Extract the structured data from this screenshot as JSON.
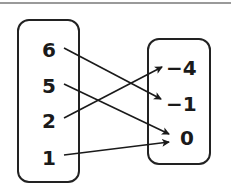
{
  "diagram": {
    "type": "mapping",
    "domain": [
      "6",
      "5",
      "2",
      "1"
    ],
    "range": [
      "−4",
      "−1",
      "0"
    ],
    "mappings": [
      {
        "from": "6",
        "to": "−1"
      },
      {
        "from": "5",
        "to": "0"
      },
      {
        "from": "2",
        "to": "−4"
      },
      {
        "from": "1",
        "to": "0"
      }
    ]
  },
  "colors": {
    "line": "#1a1a1a",
    "border": "#222222"
  }
}
